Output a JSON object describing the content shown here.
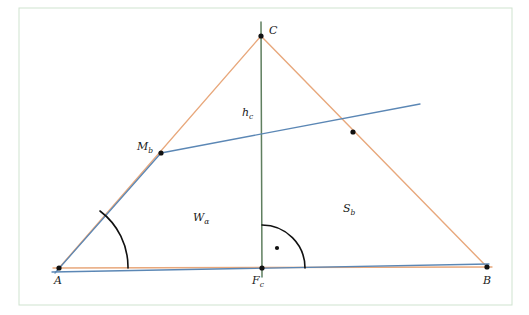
{
  "figure": {
    "title_visible": false,
    "background_color": "#ffffff",
    "frame": {
      "name": "diagram-frame",
      "color": "#cfe3cf",
      "x": 19,
      "y": 8,
      "width": 493,
      "height": 297,
      "stroke_width": 1
    },
    "colors": {
      "triangle_side": "#e8a87c",
      "cevian_blue": "#5b87b5",
      "altitude_green": "#5f7f5f",
      "point": "#111111",
      "arc": "#111111",
      "frame": "#cfe3cf"
    }
  },
  "points": [
    {
      "id": "A",
      "label": "A",
      "sub": "",
      "x": 59,
      "y": 268,
      "label_x": 54,
      "label_y": 284,
      "dot": true
    },
    {
      "id": "B",
      "label": "B",
      "sub": "",
      "x": 487,
      "y": 267,
      "label_x": 483,
      "label_y": 284,
      "dot": true
    },
    {
      "id": "C",
      "label": "C",
      "sub": "",
      "x": 261,
      "y": 36,
      "label_x": 269,
      "label_y": 34,
      "dot": true
    },
    {
      "id": "Mb",
      "label": "M",
      "sub": "b",
      "x": 161,
      "y": 153,
      "label_x": 137,
      "label_y": 150,
      "dot": true
    },
    {
      "id": "Fc",
      "label": "F",
      "sub": "c",
      "x": 262,
      "y": 268,
      "label_x": 252,
      "label_y": 284,
      "dot": true
    },
    {
      "id": "Wx",
      "label": "",
      "sub": "",
      "x": 353,
      "y": 132,
      "label_x": 0,
      "label_y": 0,
      "dot": true
    }
  ],
  "segments": [
    {
      "id": "AB",
      "name": "triangle-side-ab",
      "color": "#e8a87c",
      "x1": 53,
      "y1": 268,
      "x2": 492,
      "y2": 267,
      "width": 1.4
    },
    {
      "id": "AC",
      "name": "triangle-side-ac",
      "color": "#e8a87c",
      "x1": 59,
      "y1": 268,
      "x2": 261,
      "y2": 36,
      "width": 1.4
    },
    {
      "id": "CB",
      "name": "triangle-side-cb",
      "color": "#e8a87c",
      "x1": 261,
      "y1": 36,
      "x2": 487,
      "y2": 267,
      "width": 1.4
    },
    {
      "id": "hc",
      "name": "altitude-hc",
      "color": "#5f7f5f",
      "x1": 261,
      "y1": 22,
      "x2": 262,
      "y2": 277,
      "width": 1.5
    },
    {
      "id": "Wa",
      "name": "angle-bisector-w-alpha",
      "color": "#5b87b5",
      "x1": 52,
      "y1": 272,
      "x2": 489,
      "y2": 264,
      "width": 1.3
    },
    {
      "id": "Sb",
      "name": "median-s-b",
      "color": "#5b87b5",
      "x1": 161,
      "y1": 153,
      "x2": 420,
      "y2": 104,
      "width": 1.3
    },
    {
      "id": "SbL",
      "name": "median-s-b-left",
      "color": "#5b87b5",
      "x1": 161,
      "y1": 153,
      "x2": 55,
      "y2": 273,
      "width": 1.3
    }
  ],
  "labels": [
    {
      "id": "hc_label",
      "name": "label-h-c",
      "base": "h",
      "sub": "c",
      "x": 242,
      "y": 116
    },
    {
      "id": "Wa_label",
      "name": "label-w-alpha",
      "base": "W",
      "sub": "α",
      "x": 193,
      "y": 221
    },
    {
      "id": "Sb_label",
      "name": "label-s-b",
      "base": "S",
      "sub": "b",
      "x": 343,
      "y": 212
    }
  ],
  "arcs": [
    {
      "id": "alpha-arc",
      "name": "angle-arc-alpha",
      "description": "angle at vertex A between base AB and side AC",
      "path": "M 128 268 A 70 70 0 0 0 100 211",
      "color": "#111111",
      "width": 1.6
    },
    {
      "id": "right-angle-arc",
      "name": "right-angle-arc-fc",
      "description": "right angle at foot of altitude F_c",
      "path": "M 305 268 A 43 43 0 0 0 262 225",
      "color": "#111111",
      "width": 1.6
    }
  ],
  "right_angle_dot": {
    "name": "right-angle-dot",
    "x": 277,
    "y": 248,
    "r": 2.1
  },
  "geometry_notes": {
    "shape": "triangle",
    "vertices": [
      "A",
      "B",
      "C"
    ],
    "cevians": [
      "h_c",
      "W_α",
      "S_b"
    ],
    "special_points": [
      "M_b",
      "F_c"
    ]
  }
}
